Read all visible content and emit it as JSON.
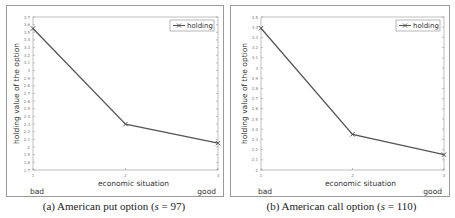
{
  "chart_data": [
    {
      "type": "line",
      "title": "",
      "caption": "(a) American put option (s = 97)",
      "xlabel": "economic situation",
      "ylabel": "holding value of the option",
      "x": [
        1,
        2,
        3
      ],
      "x_tick_labels": [
        "1",
        "2",
        "3"
      ],
      "x_annotations": {
        "left": "bad",
        "right": "good"
      },
      "ylim": [
        1.7,
        3.7
      ],
      "y_ticks": [
        1.7,
        1.8,
        1.9,
        2.0,
        2.1,
        2.2,
        2.3,
        2.4,
        2.5,
        2.6,
        2.7,
        2.8,
        2.9,
        3.0,
        3.1,
        3.2,
        3.3,
        3.4,
        3.5,
        3.6,
        3.7
      ],
      "y_tick_labels": [
        "1.7",
        "1.8",
        "1.9",
        "2",
        "2.1",
        "2.2",
        "2.3",
        "2.4",
        "2.5",
        "2.6",
        "2.7",
        "2.8",
        "2.9",
        "3",
        "3.1",
        "3.2",
        "3.3",
        "3.4",
        "3.5",
        "3.6",
        "3.7"
      ],
      "series": [
        {
          "name": "holding",
          "values": [
            3.55,
            2.3,
            2.05
          ],
          "marker": "x",
          "color": "#555555"
        }
      ],
      "legend_position": "upper right",
      "grid": false
    },
    {
      "type": "line",
      "title": "",
      "caption": "(b) American call option (s = 110)",
      "xlabel": "economic situation",
      "ylabel": "holding value of the option",
      "x": [
        1,
        2,
        3
      ],
      "x_tick_labels": [
        "1",
        "2",
        "3"
      ],
      "x_annotations": {
        "left": "bad",
        "right": "good"
      },
      "ylim": [
        2.0,
        3.5
      ],
      "y_ticks": [
        2.0,
        2.1,
        2.2,
        2.3,
        2.4,
        2.5,
        2.6,
        2.7,
        2.8,
        2.9,
        3.0,
        3.1,
        3.2,
        3.3,
        3.4,
        3.5
      ],
      "y_tick_labels": [
        "2",
        "2.1",
        "2.2",
        "2.3",
        "2.4",
        "2.5",
        "2.6",
        "2.7",
        "2.8",
        "2.9",
        "3",
        "3.1",
        "3.2",
        "3.3",
        "3.4",
        "3.5"
      ],
      "series": [
        {
          "name": "holding",
          "values": [
            3.39,
            2.35,
            2.15
          ],
          "marker": "x",
          "color": "#555555"
        }
      ],
      "legend_position": "upper right",
      "grid": false
    }
  ],
  "panels": [
    {
      "caption_prefix": "(a) American put option (",
      "caption_var": "s",
      "caption_suffix": " = 97)"
    },
    {
      "caption_prefix": "(b) American call option (",
      "caption_var": "s",
      "caption_suffix": " = 110)"
    }
  ]
}
